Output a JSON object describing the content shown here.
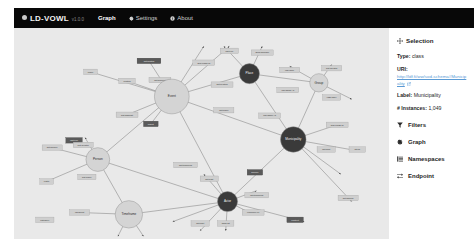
{
  "navbar": {
    "brand": "LD-VOWL",
    "brand_icon": "circle-logo-icon",
    "version": "v1.0.0",
    "links": [
      {
        "label": "Graph",
        "icon": "none",
        "active": true
      },
      {
        "label": "Settings",
        "icon": "gear-icon",
        "active": false
      },
      {
        "label": "About",
        "icon": "info-icon",
        "active": false
      }
    ]
  },
  "sidebar": {
    "selection": {
      "title": "Selection",
      "title_icon": "move-arrows-icon",
      "type_label": "Type:",
      "type_value": "class",
      "uri_label": "URI:",
      "uri_value": "http://ldf.fi/ww/sod-schema#Municipality",
      "uri_external_icon": "external-link-icon",
      "label_label": "Label:",
      "label_value": "Municipality",
      "instances_label": "# Instances:",
      "instances_value": "1,049"
    },
    "menu": [
      {
        "label": "Filters",
        "icon": "funnel-icon"
      },
      {
        "label": "Graph",
        "icon": "gear-icon"
      },
      {
        "label": "Namespaces",
        "icon": "list-icon"
      },
      {
        "label": "Endpoint",
        "icon": "exchange-icon"
      }
    ]
  },
  "colors": {
    "navbar_bg": "#080808",
    "graph_bg": "#e9e9e9",
    "node_fill": "#d4d4d4",
    "node_selected_fill": "#3a3a3a",
    "edge_stroke": "#6d6d6d",
    "link_blue": "#5b9bd5"
  },
  "graph": {
    "nodes": [
      {
        "id": "event",
        "label": "Event",
        "x": 155,
        "y": 75,
        "r": 19,
        "dark": false
      },
      {
        "id": "place",
        "label": "Place",
        "x": 240,
        "y": 50,
        "r": 11,
        "dark": true
      },
      {
        "id": "group",
        "label": "Group",
        "x": 316,
        "y": 60,
        "r": 10,
        "dark": false
      },
      {
        "id": "municipality",
        "label": "Municipality",
        "x": 288,
        "y": 122,
        "r": 14,
        "dark": true
      },
      {
        "id": "person",
        "label": "Person",
        "x": 74,
        "y": 144,
        "r": 13,
        "dark": false
      },
      {
        "id": "timeframe",
        "label": "Timeframe",
        "x": 108,
        "y": 204,
        "r": 15,
        "dark": false
      },
      {
        "id": "actor",
        "label": "Actor",
        "x": 216,
        "y": 190,
        "r": 11,
        "dark": true
      }
    ],
    "edge_labels": [
      {
        "text": "dct:spatial",
        "x": 130,
        "y": 36,
        "w": 26,
        "h": 6,
        "dark": true
      },
      {
        "text": "sub-class-of",
        "x": 190,
        "y": 38,
        "w": 24,
        "h": 6,
        "dark": false
      },
      {
        "text": "rdf:type",
        "x": 218,
        "y": 25,
        "w": 20,
        "h": 6,
        "dark": false
      },
      {
        "text": "skos:broader",
        "x": 254,
        "y": 27,
        "w": 24,
        "h": 6,
        "dark": false
      },
      {
        "text": "place",
        "x": 66,
        "y": 48,
        "w": 15,
        "h": 6,
        "dark": false
      },
      {
        "text": "related",
        "x": 106,
        "y": 58,
        "w": 18,
        "h": 6,
        "dark": false
      },
      {
        "text": "dct:subject",
        "x": 142,
        "y": 57,
        "w": 24,
        "h": 6,
        "dark": false
      },
      {
        "text": "rdf:value",
        "x": 284,
        "y": 46,
        "w": 22,
        "h": 6,
        "dark": false
      },
      {
        "text": "dct:related",
        "x": 210,
        "y": 62,
        "w": 24,
        "h": 6,
        "dark": false
      },
      {
        "text": "owl:sameAs",
        "x": 282,
        "y": 68,
        "w": 24,
        "h": 6,
        "dark": false
      },
      {
        "text": "dct:creator",
        "x": 330,
        "y": 44,
        "w": 22,
        "h": 6,
        "dark": false
      },
      {
        "text": "rdfs:label",
        "x": 330,
        "y": 76,
        "w": 20,
        "h": 6,
        "dark": false
      },
      {
        "text": "dct:hasPart",
        "x": 106,
        "y": 95,
        "w": 24,
        "h": 6,
        "dark": false
      },
      {
        "text": "agent",
        "x": 132,
        "y": 105,
        "w": 16,
        "h": 6,
        "dark": true
      },
      {
        "text": "dct:place",
        "x": 212,
        "y": 90,
        "w": 22,
        "h": 6,
        "dark": false
      },
      {
        "text": "owl:sameAs",
        "x": 262,
        "y": 96,
        "w": 24,
        "h": 6,
        "dark": false
      },
      {
        "text": "sub-class-of",
        "x": 336,
        "y": 106,
        "w": 24,
        "h": 6,
        "dark": false
      },
      {
        "text": "dct:part",
        "x": 324,
        "y": 133,
        "w": 20,
        "h": 6,
        "dark": false
      },
      {
        "text": "literal",
        "x": 358,
        "y": 133,
        "w": 18,
        "h": 6,
        "dark": false
      },
      {
        "text": "dct:source",
        "x": 24,
        "y": 131,
        "w": 22,
        "h": 6,
        "dark": false
      },
      {
        "text": "rdf:type",
        "x": 48,
        "y": 123,
        "w": 18,
        "h": 6,
        "dark": true
      },
      {
        "text": "dct:creator",
        "x": 58,
        "y": 128,
        "w": 22,
        "h": 6,
        "dark": false
      },
      {
        "text": "dct:place",
        "x": 62,
        "y": 163,
        "w": 20,
        "h": 6,
        "dark": false
      },
      {
        "text": "entity",
        "x": 18,
        "y": 168,
        "w": 15,
        "h": 6,
        "dark": false
      },
      {
        "text": "dct:temporal",
        "x": 170,
        "y": 150,
        "w": 26,
        "h": 6,
        "dark": false
      },
      {
        "text": "source",
        "x": 246,
        "y": 158,
        "w": 17,
        "h": 6,
        "dark": true
      },
      {
        "text": "dct:temporal",
        "x": 248,
        "y": 183,
        "w": 26,
        "h": 6,
        "dark": false
      },
      {
        "text": "dct:part",
        "x": 196,
        "y": 165,
        "w": 20,
        "h": 6,
        "dark": false
      },
      {
        "text": "resource-of",
        "x": 244,
        "y": 202,
        "w": 24,
        "h": 6,
        "dark": false
      },
      {
        "text": "context",
        "x": 290,
        "y": 210,
        "w": 18,
        "h": 6,
        "dark": true
      },
      {
        "text": "dct:part",
        "x": 186,
        "y": 214,
        "w": 20,
        "h": 6,
        "dark": false
      },
      {
        "text": "skos:alt",
        "x": 214,
        "y": 214,
        "w": 18,
        "h": 6,
        "dark": false
      },
      {
        "text": "rdf:about",
        "x": 54,
        "y": 202,
        "w": 22,
        "h": 6,
        "dark": false
      },
      {
        "text": "category",
        "x": 16,
        "y": 210,
        "w": 20,
        "h": 6,
        "dark": false
      },
      {
        "text": "dct:issued",
        "x": 348,
        "y": 186,
        "w": 22,
        "h": 6,
        "dark": false
      }
    ],
    "edges": [
      {
        "x1": 155,
        "y1": 75,
        "x2": 240,
        "y2": 50
      },
      {
        "x1": 155,
        "y1": 75,
        "x2": 130,
        "y2": 36
      },
      {
        "x1": 155,
        "y1": 75,
        "x2": 190,
        "y2": 20
      },
      {
        "x1": 155,
        "y1": 75,
        "x2": 218,
        "y2": 20
      },
      {
        "x1": 155,
        "y1": 75,
        "x2": 66,
        "y2": 48
      },
      {
        "x1": 155,
        "y1": 75,
        "x2": 106,
        "y2": 58
      },
      {
        "x1": 155,
        "y1": 75,
        "x2": 106,
        "y2": 95
      },
      {
        "x1": 155,
        "y1": 75,
        "x2": 132,
        "y2": 105
      },
      {
        "x1": 155,
        "y1": 75,
        "x2": 288,
        "y2": 122
      },
      {
        "x1": 155,
        "y1": 75,
        "x2": 216,
        "y2": 190
      },
      {
        "x1": 155,
        "y1": 75,
        "x2": 74,
        "y2": 144
      },
      {
        "x1": 240,
        "y1": 50,
        "x2": 316,
        "y2": 60
      },
      {
        "x1": 240,
        "y1": 50,
        "x2": 288,
        "y2": 122
      },
      {
        "x1": 240,
        "y1": 50,
        "x2": 254,
        "y2": 20
      },
      {
        "x1": 240,
        "y1": 50,
        "x2": 212,
        "y2": 20
      },
      {
        "x1": 316,
        "y1": 60,
        "x2": 288,
        "y2": 122
      },
      {
        "x1": 316,
        "y1": 60,
        "x2": 330,
        "y2": 40
      },
      {
        "x1": 316,
        "y1": 60,
        "x2": 352,
        "y2": 78
      },
      {
        "x1": 316,
        "y1": 60,
        "x2": 284,
        "y2": 42
      },
      {
        "x1": 288,
        "y1": 122,
        "x2": 336,
        "y2": 106
      },
      {
        "x1": 288,
        "y1": 122,
        "x2": 356,
        "y2": 134
      },
      {
        "x1": 288,
        "y1": 122,
        "x2": 216,
        "y2": 190
      },
      {
        "x1": 288,
        "y1": 122,
        "x2": 340,
        "y2": 160
      },
      {
        "x1": 74,
        "y1": 144,
        "x2": 24,
        "y2": 131
      },
      {
        "x1": 74,
        "y1": 144,
        "x2": 18,
        "y2": 168
      },
      {
        "x1": 74,
        "y1": 144,
        "x2": 108,
        "y2": 204
      },
      {
        "x1": 74,
        "y1": 144,
        "x2": 216,
        "y2": 190
      },
      {
        "x1": 74,
        "y1": 144,
        "x2": 60,
        "y2": 120
      },
      {
        "x1": 108,
        "y1": 204,
        "x2": 54,
        "y2": 202
      },
      {
        "x1": 108,
        "y1": 204,
        "x2": 96,
        "y2": 228
      },
      {
        "x1": 108,
        "y1": 204,
        "x2": 124,
        "y2": 228
      },
      {
        "x1": 108,
        "y1": 204,
        "x2": 216,
        "y2": 190
      },
      {
        "x1": 216,
        "y1": 190,
        "x2": 186,
        "y2": 222
      },
      {
        "x1": 216,
        "y1": 190,
        "x2": 214,
        "y2": 222
      },
      {
        "x1": 216,
        "y1": 190,
        "x2": 244,
        "y2": 204
      },
      {
        "x1": 216,
        "y1": 190,
        "x2": 300,
        "y2": 212
      },
      {
        "x1": 216,
        "y1": 190,
        "x2": 248,
        "y2": 178
      },
      {
        "x1": 216,
        "y1": 190,
        "x2": 190,
        "y2": 160
      },
      {
        "x1": 216,
        "y1": 190,
        "x2": 156,
        "y2": 212
      },
      {
        "x1": 288,
        "y1": 122,
        "x2": 352,
        "y2": 190
      }
    ]
  }
}
